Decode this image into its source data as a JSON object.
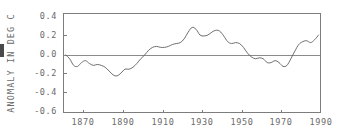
{
  "chart_data": {
    "type": "line",
    "title": "",
    "subtitle": "",
    "xlabel": "",
    "ylabel": "ANOMALY IN DEG C",
    "xlim": [
      1860,
      1990
    ],
    "ylim": [
      -0.6,
      0.4
    ],
    "grid": false,
    "legend": null,
    "annotations": [
      {
        "name": "zero-reference-line",
        "y": -0.02,
        "description": "horizontal reference line near zero anomaly"
      }
    ],
    "y_ticks": [
      "0.4",
      "0.2",
      "0.0",
      "-0.2",
      "-0.4",
      "-0.6"
    ],
    "y_tick_values": [
      0.4,
      0.2,
      0.0,
      -0.2,
      -0.4,
      -0.6
    ],
    "x_ticks": [
      "1870",
      "1890",
      "1910",
      "1930",
      "1950",
      "1970",
      "1990"
    ],
    "x_tick_values": [
      1870,
      1890,
      1910,
      1930,
      1950,
      1970,
      1990
    ],
    "series": [
      {
        "name": "global temperature anomaly",
        "x": [
          1861,
          1863,
          1865,
          1867,
          1869,
          1871,
          1873,
          1875,
          1877,
          1879,
          1881,
          1883,
          1885,
          1887,
          1889,
          1891,
          1893,
          1895,
          1897,
          1899,
          1901,
          1903,
          1905,
          1907,
          1909,
          1911,
          1913,
          1915,
          1917,
          1919,
          1921,
          1923,
          1925,
          1927,
          1929,
          1931,
          1933,
          1935,
          1937,
          1939,
          1941,
          1943,
          1945,
          1947,
          1949,
          1951,
          1953,
          1955,
          1957,
          1959,
          1961,
          1963,
          1965,
          1967,
          1969,
          1971,
          1973,
          1975,
          1977,
          1979,
          1981,
          1983,
          1985,
          1987,
          1989
        ],
        "values": [
          -0.01,
          -0.05,
          -0.12,
          -0.13,
          -0.09,
          -0.07,
          -0.1,
          -0.12,
          -0.11,
          -0.12,
          -0.14,
          -0.18,
          -0.22,
          -0.23,
          -0.2,
          -0.16,
          -0.16,
          -0.14,
          -0.1,
          -0.05,
          -0.01,
          0.04,
          0.07,
          0.08,
          0.07,
          0.07,
          0.08,
          0.1,
          0.11,
          0.12,
          0.16,
          0.23,
          0.28,
          0.26,
          0.2,
          0.19,
          0.2,
          0.23,
          0.25,
          0.24,
          0.19,
          0.13,
          0.11,
          0.12,
          0.11,
          0.07,
          0.01,
          -0.03,
          -0.05,
          -0.04,
          -0.05,
          -0.09,
          -0.09,
          -0.07,
          -0.09,
          -0.13,
          -0.12,
          -0.05,
          0.03,
          0.1,
          0.13,
          0.14,
          0.12,
          0.15,
          0.2
        ]
      }
    ]
  },
  "axis": {
    "y_title": "ANOMALY IN DEG C"
  }
}
